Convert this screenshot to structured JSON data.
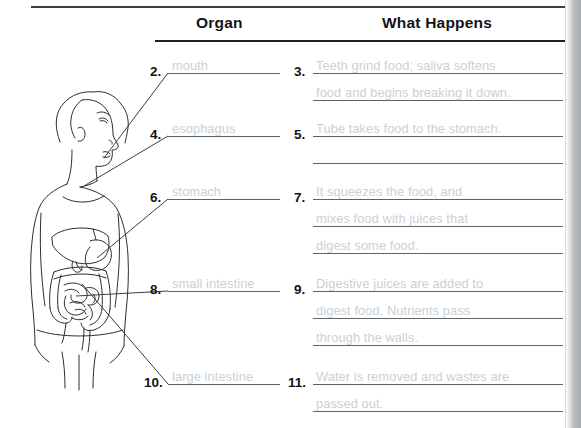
{
  "page": {
    "width": 581,
    "height": 428,
    "background": "#ffffff",
    "answer_text_color": "#cbd0d3",
    "rule_color": "#3c4042",
    "line_color": "#5d6366"
  },
  "headers": {
    "organ": "Organ",
    "what_happens": "What Happens"
  },
  "organ_column": [
    {
      "number": "2.",
      "answer": "mouth"
    },
    {
      "number": "4.",
      "answer": "esophagus"
    },
    {
      "number": "6.",
      "answer": "stomach"
    },
    {
      "number": "8.",
      "answer": "small intestine"
    },
    {
      "number": "10.",
      "answer": "large intestine"
    }
  ],
  "what_happens_column": [
    {
      "number": "3.",
      "lines": [
        "Teeth grind food; saliva softens",
        "food and begins breaking it down."
      ]
    },
    {
      "number": "5.",
      "lines": [
        "Tube takes food to the stomach.",
        ""
      ]
    },
    {
      "number": "7.",
      "lines": [
        "It squeezes the food, and",
        "mixes food with juices that",
        "digest some food."
      ]
    },
    {
      "number": "9.",
      "lines": [
        "Digestive juices are added to",
        "digest food. Nutrients pass",
        "through the walls."
      ]
    },
    {
      "number": "11.",
      "lines": [
        "Water is removed and wastes are",
        "passed out."
      ]
    }
  ],
  "figure": {
    "label": "human-digestive-system-diagram",
    "leader_lines": 5
  }
}
